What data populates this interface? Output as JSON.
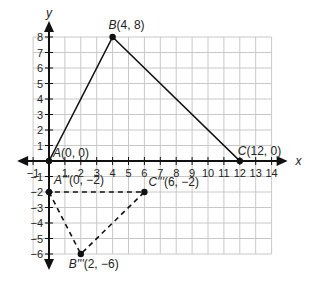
{
  "diagram": {
    "axes": {
      "x_label": "x",
      "y_label": "y",
      "x_ticks": [
        "-1",
        "1",
        "2",
        "3",
        "4",
        "5",
        "6",
        "7",
        "8",
        "9",
        "10",
        "11",
        "12",
        "13",
        "14"
      ],
      "y_ticks": [
        "8",
        "7",
        "6",
        "5",
        "4",
        "3",
        "2",
        "1",
        "-1",
        "-2",
        "-3",
        "-4",
        "-5",
        "-6"
      ],
      "x_range": [
        -1,
        14
      ],
      "y_range": [
        -6,
        8
      ]
    },
    "original_triangle": {
      "style": "solid",
      "points": [
        {
          "name": "A",
          "label": "A(0, 0)",
          "x": 0,
          "y": 0
        },
        {
          "name": "B",
          "label": "B(4, 8)",
          "x": 4,
          "y": 8
        },
        {
          "name": "C",
          "label": "C(12, 0)",
          "x": 12,
          "y": 0
        }
      ]
    },
    "image_triangle": {
      "style": "dashed",
      "points": [
        {
          "name": "A'''",
          "label": "A'''(0, −2)",
          "x": 0,
          "y": -2
        },
        {
          "name": "B'''",
          "label": "B'''(2, −6)",
          "x": 2,
          "y": -6
        },
        {
          "name": "C'''",
          "label": "C'''(6, −2)",
          "x": 6,
          "y": -2
        }
      ]
    },
    "colors": {
      "grid": "#c8c8c8",
      "axis": "#111111",
      "line": "#111111",
      "background": "#ffffff"
    }
  }
}
